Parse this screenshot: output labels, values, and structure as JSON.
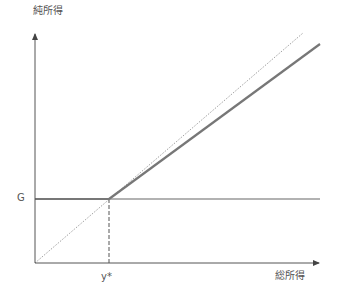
{
  "diagram": {
    "y_axis_label": "純所得",
    "x_axis_label": "総所得",
    "g_label": "G",
    "threshold_label": "y*",
    "colors": {
      "axis": "#555555",
      "net_income_line": "#777777",
      "reference_line": "#888888",
      "text": "#555555"
    },
    "elements": [
      {
        "name": "y-axis",
        "type": "arrow",
        "from": [
          35,
          263
        ],
        "to": [
          35,
          33
        ]
      },
      {
        "name": "x-axis",
        "type": "arrow",
        "from": [
          35,
          263
        ],
        "to": [
          320,
          263
        ]
      },
      {
        "name": "guarantee-line",
        "type": "solid",
        "from": [
          35,
          199
        ],
        "to": [
          320,
          199
        ]
      },
      {
        "name": "45-degree-line",
        "type": "dotted",
        "from": [
          35,
          263
        ],
        "to": [
          303,
          33
        ]
      },
      {
        "name": "net-income-line",
        "type": "thick",
        "from": [
          109,
          199
        ],
        "to": [
          320,
          44
        ]
      },
      {
        "name": "threshold-line",
        "type": "dashed",
        "from": [
          109,
          199
        ],
        "to": [
          109,
          263
        ]
      }
    ]
  }
}
